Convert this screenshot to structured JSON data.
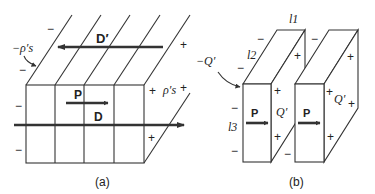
{
  "figure": {
    "panel_a": {
      "caption": "(a)",
      "vector_labels": {
        "P": "P",
        "D": "D",
        "D_prime": "D′"
      },
      "charge_labels": {
        "neg_surface": "−ρ′s",
        "pos_surface": "ρ′s"
      },
      "signs": {
        "minus": "−",
        "plus": "+"
      }
    },
    "panel_b": {
      "caption": "(b)",
      "dimension_labels": {
        "l1": "l1",
        "l2": "l2",
        "l3": "l3"
      },
      "vector_labels": {
        "P": "P"
      },
      "charge_labels": {
        "neg": "−Q′",
        "pos": "Q′"
      },
      "signs": {
        "minus": "−",
        "plus": "+"
      }
    }
  }
}
